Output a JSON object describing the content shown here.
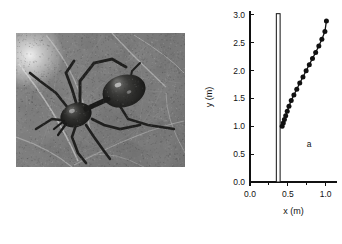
{
  "figure": {
    "panel_a_letter": "a",
    "photo": {
      "alt_name": "spider-photograph",
      "description": "grayscale photograph of a dark spider on a leaf"
    }
  },
  "chart_data": {
    "type": "scatter",
    "title": "",
    "subtitle": "",
    "xlabel": "x (m)",
    "ylabel": "y (m)",
    "xlim": [
      0.0,
      1.15
    ],
    "ylim": [
      0.0,
      3.05
    ],
    "grid": false,
    "legend": null,
    "annotations": [
      {
        "text": "a",
        "x": 0.78,
        "y": 0.62
      }
    ],
    "xticks": [
      0.0,
      0.5,
      1.0
    ],
    "xtick_labels": [
      "0.0",
      "0.5",
      "1.0"
    ],
    "yticks": [
      0.0,
      0.5,
      1.0,
      1.5,
      2.0,
      2.5,
      3.0
    ],
    "ytick_labels": [
      "0.0",
      "0.5",
      "1.0",
      "1.5",
      "2.0",
      "2.5",
      "3.0"
    ],
    "xminor_ticks": [
      0.25,
      0.75
    ],
    "series": [
      {
        "name": "trajectory",
        "marker": "filled-circle",
        "color": "#111111",
        "x": [
          0.425,
          0.44,
          0.455,
          0.472,
          0.492,
          0.515,
          0.545,
          0.58,
          0.618,
          0.658,
          0.7,
          0.742,
          0.784,
          0.826,
          0.868,
          0.91,
          0.95,
          0.99,
          1.01
        ],
        "y": [
          1.0,
          1.06,
          1.12,
          1.19,
          1.27,
          1.36,
          1.46,
          1.56,
          1.665,
          1.775,
          1.885,
          1.995,
          2.105,
          2.215,
          2.325,
          2.44,
          2.56,
          2.7,
          2.89
        ]
      }
    ],
    "shapes": [
      {
        "name": "vertical-rod",
        "type": "rectangle",
        "x0": 0.348,
        "x1": 0.398,
        "y0": 0.0,
        "y1": 3.02,
        "fill": "#ffffff",
        "stroke": "#111111"
      }
    ]
  },
  "colors": {
    "ink": "#111111",
    "paper": "#ffffff"
  }
}
